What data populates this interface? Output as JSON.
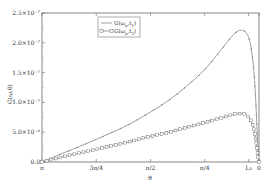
{
  "chart_data": {
    "type": "line",
    "title": "",
    "xlabel": "θ",
    "ylabel": "G(ω,θ)",
    "x_tick_labels": [
      "π",
      "3π/4",
      "π/2",
      "π/4",
      "L₀",
      "0"
    ],
    "x_tick_positions": [
      3.1416,
      2.3562,
      1.5708,
      0.7854,
      0.15,
      0
    ],
    "xlim": [
      3.1416,
      0
    ],
    "y_tick_labels": [
      "0.0",
      "5.0×10⁻⁸",
      "1.0×10⁻⁷",
      "1.5×10⁻⁷",
      "2.0×10⁻⁷",
      "2.5×10⁻⁷"
    ],
    "y_tick_values": [
      0,
      5e-08,
      1e-07,
      1.5e-07,
      2e-07,
      2.5e-07
    ],
    "ylim": [
      0,
      2.5e-07
    ],
    "grid": false,
    "legend_position": "upper-left-center",
    "series": [
      {
        "name": "G(ω_p,t₁)",
        "marker": "none",
        "line": "solid",
        "x": [
          3.1416,
          2.9,
          2.6,
          2.3562,
          2.1,
          1.85,
          1.5708,
          1.3,
          1.05,
          0.7854,
          0.55,
          0.4,
          0.3,
          0.22,
          0.16,
          0.12,
          0.08,
          0.05,
          0.03,
          0.01,
          0
        ],
        "y": [
          0,
          1.2e-08,
          2.6e-08,
          3.8e-08,
          5.1e-08,
          6.5e-08,
          8.4e-08,
          1.04e-07,
          1.27e-07,
          1.55e-07,
          1.88e-07,
          2.1e-07,
          2.2e-07,
          2.2e-07,
          2.12e-07,
          1.95e-07,
          1.6e-07,
          1.1e-07,
          6e-08,
          1.5e-08,
          0
        ]
      },
      {
        "name": "G(ω_p,t₂)",
        "marker": "square",
        "line": "solid",
        "x": [
          3.1416,
          2.9,
          2.6,
          2.3562,
          2.1,
          1.85,
          1.5708,
          1.3,
          1.05,
          0.7854,
          0.55,
          0.4,
          0.3,
          0.22,
          0.16,
          0.12,
          0.08,
          0.05,
          0.03,
          0.01,
          0
        ],
        "y": [
          0,
          7e-09,
          1.5e-08,
          2.1e-08,
          2.8e-08,
          3.5e-08,
          4.3e-08,
          5e-08,
          5.8e-08,
          6.6e-08,
          7.4e-08,
          7.9e-08,
          8.1e-08,
          8.1e-08,
          7.7e-08,
          7e-08,
          5.8e-08,
          4e-08,
          2.3e-08,
          6e-09,
          0
        ]
      }
    ]
  },
  "legend": {
    "items": [
      {
        "label": "G(ω",
        "sub": "p",
        "tail": ",t",
        "sub2": "1",
        "close": ")"
      },
      {
        "label": "G(ω",
        "sub": "p",
        "tail": ",t",
        "sub2": "2",
        "close": ")"
      }
    ]
  },
  "axes": {
    "y_title": "G(ω,θ)",
    "x_title": "θ"
  }
}
